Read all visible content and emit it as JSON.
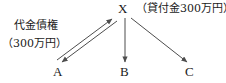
{
  "diagram": {
    "nodes": [
      {
        "id": "x",
        "label": "X"
      },
      {
        "id": "a",
        "label": "A"
      },
      {
        "id": "b",
        "label": "B"
      },
      {
        "id": "c",
        "label": "C"
      }
    ],
    "annotations": {
      "loan_note": "（貸付金300万円）",
      "claim_note_line1": "代金債権",
      "claim_note_line2": "（300万円）"
    },
    "edges": [
      {
        "id": "a-to-x",
        "from": "A",
        "to": "X",
        "style": "solid",
        "arrow": "end"
      },
      {
        "id": "x-to-a",
        "from": "X",
        "to": "A",
        "style": "solid",
        "arrow": "end"
      },
      {
        "id": "x-to-b",
        "from": "X",
        "to": "B",
        "style": "solid",
        "arrow": "end"
      },
      {
        "id": "x-to-c",
        "from": "X",
        "to": "C",
        "style": "solid",
        "arrow": "end"
      }
    ],
    "colors": {
      "background": "#ffffff",
      "line": "#4d4d4d",
      "text": "#1a1a1a"
    }
  }
}
